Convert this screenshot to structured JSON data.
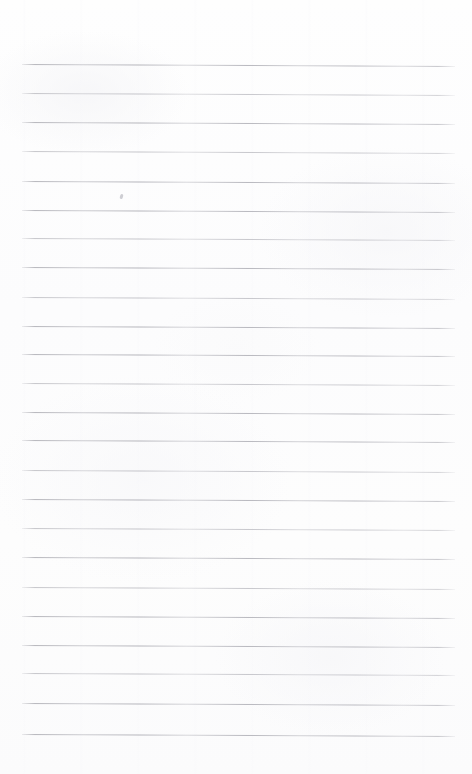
{
  "document": {
    "kind": "scanned-ruled-paper",
    "description": "Blank lined notepad page, scanned",
    "page_width": 472,
    "page_height": 774,
    "background_color": "#fdfdfd",
    "has_text": false,
    "has_border": false,
    "text_content": ""
  },
  "ruling": {
    "line_color": "#b9b9bd",
    "line_thickness_px": 1,
    "line_count": 24,
    "first_line_y": 64,
    "last_line_y": 734,
    "line_spacing_px": 29.1,
    "left_margin_x": 22,
    "right_edge_x": 455,
    "line_length_px": 433,
    "tilt_drop_px": 2,
    "lines": [
      {
        "index": 1,
        "y": 64,
        "weight": "darker"
      },
      {
        "index": 2,
        "y": 93,
        "weight": "lighter"
      },
      {
        "index": 3,
        "y": 122,
        "weight": "darker"
      },
      {
        "index": 4,
        "y": 151,
        "weight": "lighter"
      },
      {
        "index": 5,
        "y": 181,
        "weight": "darker"
      },
      {
        "index": 6,
        "y": 210,
        "weight": "darker"
      },
      {
        "index": 7,
        "y": 238,
        "weight": "lighter"
      },
      {
        "index": 8,
        "y": 267,
        "weight": "darker"
      },
      {
        "index": 9,
        "y": 297,
        "weight": "lighter"
      },
      {
        "index": 10,
        "y": 326,
        "weight": "darker"
      },
      {
        "index": 11,
        "y": 354,
        "weight": "darker"
      },
      {
        "index": 12,
        "y": 383,
        "weight": "lighter"
      },
      {
        "index": 13,
        "y": 412,
        "weight": "darker"
      },
      {
        "index": 14,
        "y": 440,
        "weight": "darker"
      },
      {
        "index": 15,
        "y": 470,
        "weight": "lighter"
      },
      {
        "index": 16,
        "y": 499,
        "weight": "darker"
      },
      {
        "index": 17,
        "y": 528,
        "weight": "lighter"
      },
      {
        "index": 18,
        "y": 557,
        "weight": "darker"
      },
      {
        "index": 19,
        "y": 587,
        "weight": "lighter"
      },
      {
        "index": 20,
        "y": 616,
        "weight": "darker"
      },
      {
        "index": 21,
        "y": 645,
        "weight": "darker"
      },
      {
        "index": 22,
        "y": 673,
        "weight": "lighter"
      },
      {
        "index": 23,
        "y": 703,
        "weight": "darker"
      },
      {
        "index": 24,
        "y": 734,
        "weight": "darker"
      }
    ]
  },
  "artifacts": {
    "specks": [
      {
        "x": 120,
        "y": 194
      }
    ]
  }
}
